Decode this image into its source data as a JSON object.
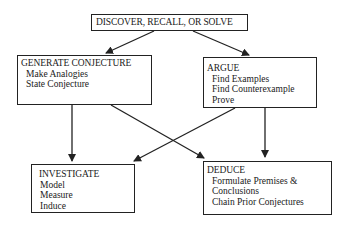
{
  "diagram": {
    "nodes": {
      "top": {
        "title": "DISCOVER, RECALL, OR SOLVE",
        "items": []
      },
      "generate": {
        "title": "GENERATE CONJECTURE",
        "items": [
          "Make Analogies",
          "State Conjecture"
        ]
      },
      "argue": {
        "title": "ARGUE",
        "items": [
          "Find Examples",
          "Find Counterexample",
          "Prove"
        ]
      },
      "investigate": {
        "title": "INVESTIGATE",
        "items": [
          "Model",
          "Measure",
          "Induce"
        ]
      },
      "deduce": {
        "title": "DEDUCE",
        "items": [
          "Formulate Premises &",
          "Conclusions",
          "Chain Prior Conjectures"
        ]
      }
    },
    "edges": [
      {
        "from": "top",
        "to": "generate"
      },
      {
        "from": "top",
        "to": "argue"
      },
      {
        "from": "generate",
        "to": "investigate"
      },
      {
        "from": "generate",
        "to": "deduce"
      },
      {
        "from": "argue",
        "to": "investigate"
      },
      {
        "from": "argue",
        "to": "deduce"
      }
    ],
    "colors": {
      "stroke": "#222222",
      "background": "#ffffff"
    }
  }
}
